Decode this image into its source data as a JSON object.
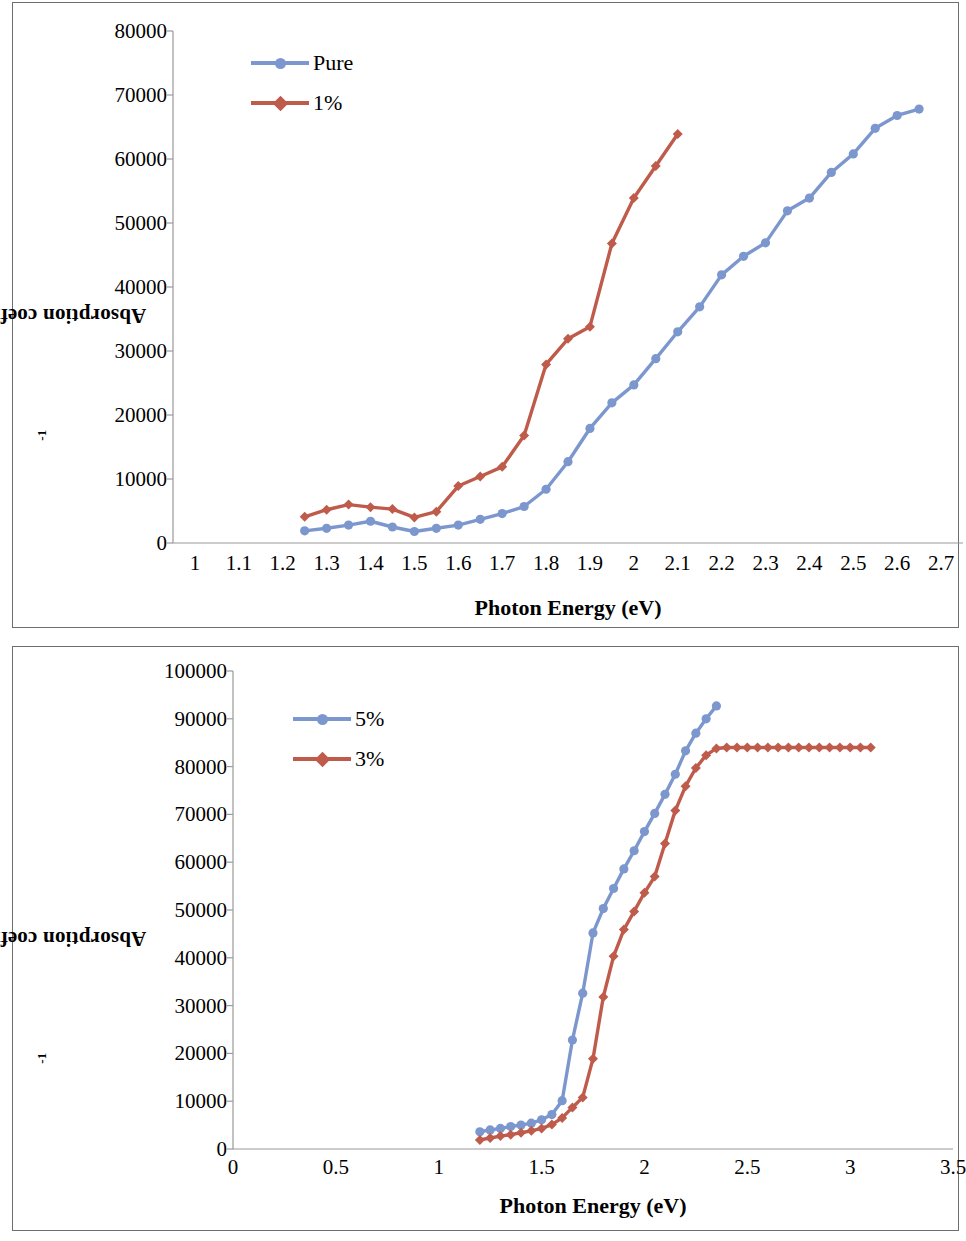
{
  "figure": {
    "panels": [
      "top",
      "bottom"
    ]
  },
  "top": {
    "y_axis_title_main": "Absorption coefficient  (cm)",
    "y_axis_title_sup": "-1",
    "x_axis_title": "Photon Energy (eV)",
    "y_ticks": [
      "0",
      "10000",
      "20000",
      "30000",
      "40000",
      "50000",
      "60000",
      "70000",
      "80000"
    ],
    "x_ticks": [
      "1",
      "1.1",
      "1.2",
      "1.3",
      "1.4",
      "1.5",
      "1.6",
      "1.7",
      "1.8",
      "1.9",
      "2",
      "2.1",
      "2.2",
      "2.3",
      "2.4",
      "2.5",
      "2.6",
      "2.7"
    ],
    "legend": [
      {
        "label": "Pure",
        "color": "#7C97CE",
        "marker": "circle"
      },
      {
        "label": "1%",
        "color": "#BF5B4B",
        "marker": "diamond"
      }
    ],
    "chart_data": {
      "type": "line",
      "title": "",
      "xlabel": "Photon Energy (eV)",
      "ylabel": "Absorption coefficient  (cm)-1",
      "xlim": [
        1.0,
        2.7
      ],
      "ylim": [
        0,
        80000
      ],
      "ytick_step": 10000,
      "xtick_step": 0.1,
      "grid": false,
      "legend_position": "top-left inside",
      "axis_kind": "category",
      "series": [
        {
          "name": "Pure",
          "color": "#7C97CE",
          "marker": "circle",
          "x": [
            1.25,
            1.3,
            1.35,
            1.4,
            1.45,
            1.5,
            1.55,
            1.6,
            1.65,
            1.7,
            1.75,
            1.8,
            1.85,
            1.9,
            1.95,
            2.0,
            2.05,
            2.1,
            2.15,
            2.2,
            2.25,
            2.3,
            2.35,
            2.4,
            2.45,
            2.5,
            2.55,
            2.6,
            2.65
          ],
          "values": [
            1900,
            2300,
            2800,
            3400,
            2500,
            1800,
            2300,
            2800,
            3700,
            4600,
            5700,
            8400,
            12700,
            17900,
            21900,
            24700,
            28800,
            33000,
            36900,
            41900,
            44800,
            46900,
            51900,
            53900,
            57900,
            60800,
            64800,
            66800,
            67800
          ]
        },
        {
          "name": "1%",
          "color": "#BF5B4B",
          "marker": "diamond",
          "x": [
            1.25,
            1.3,
            1.35,
            1.4,
            1.45,
            1.5,
            1.55,
            1.6,
            1.65,
            1.7,
            1.75,
            1.8,
            1.85,
            1.9,
            1.95,
            2.0,
            2.05,
            2.1
          ],
          "values": [
            4100,
            5200,
            6000,
            5600,
            5300,
            4000,
            4900,
            8900,
            10400,
            11900,
            16800,
            27900,
            31900,
            33800,
            46800,
            53900,
            58900,
            63900
          ]
        }
      ]
    }
  },
  "bottom": {
    "y_axis_title_main": "Absorption coefficient  (cm)",
    "y_axis_title_sup": "-1",
    "x_axis_title": "Photon Energy (eV)",
    "y_ticks": [
      "0",
      "10000",
      "20000",
      "30000",
      "40000",
      "50000",
      "60000",
      "70000",
      "80000",
      "90000",
      "100000"
    ],
    "x_ticks": [
      "0",
      "0.5",
      "1",
      "1.5",
      "2",
      "2.5",
      "3",
      "3.5"
    ],
    "legend": [
      {
        "label": "5%",
        "color": "#7C97CE",
        "marker": "circle"
      },
      {
        "label": "3%",
        "color": "#BF5B4B",
        "marker": "diamond"
      }
    ],
    "chart_data": {
      "type": "line",
      "title": "",
      "xlabel": "Photon Energy (eV)",
      "ylabel": "Absorption coefficient  (cm)-1",
      "xlim": [
        0,
        3.5
      ],
      "ylim": [
        0,
        100000
      ],
      "ytick_step": 10000,
      "xtick_step": 0.5,
      "grid": false,
      "legend_position": "top-left inside",
      "axis_kind": "numeric",
      "series": [
        {
          "name": "5%",
          "color": "#7C97CE",
          "marker": "circle",
          "x": [
            1.2,
            1.25,
            1.3,
            1.35,
            1.4,
            1.45,
            1.5,
            1.55,
            1.6,
            1.65,
            1.7,
            1.75,
            1.8,
            1.85,
            1.9,
            1.95,
            2.0,
            2.05,
            2.1,
            2.15,
            2.2,
            2.25,
            2.3,
            2.35
          ],
          "values": [
            3600,
            4000,
            4300,
            4700,
            5000,
            5400,
            6100,
            7200,
            10100,
            22800,
            32600,
            45200,
            50300,
            54500,
            58600,
            62400,
            66400,
            70200,
            74200,
            78400,
            83300,
            87000,
            90000,
            92700
          ]
        },
        {
          "name": "3%",
          "color": "#BF5B4B",
          "marker": "diamond",
          "x": [
            1.2,
            1.25,
            1.3,
            1.35,
            1.4,
            1.45,
            1.5,
            1.55,
            1.6,
            1.65,
            1.7,
            1.75,
            1.8,
            1.85,
            1.9,
            1.95,
            2.0,
            2.05,
            2.1,
            2.15,
            2.2,
            2.25,
            2.3,
            2.35,
            2.4,
            2.45,
            2.5,
            2.55,
            2.6,
            2.65,
            2.7,
            2.75,
            2.8,
            2.85,
            2.9,
            2.95,
            3.0,
            3.05,
            3.1
          ],
          "values": [
            1900,
            2300,
            2700,
            3000,
            3400,
            3800,
            4300,
            5100,
            6500,
            8700,
            10800,
            18900,
            31800,
            40300,
            45900,
            49700,
            53600,
            57000,
            63900,
            70800,
            75900,
            79700,
            82400,
            83800,
            84000,
            84000,
            84000,
            84000,
            84000,
            84000,
            84000,
            84000,
            84000,
            84000,
            84000,
            84000,
            84000,
            84000,
            84000
          ]
        }
      ]
    }
  }
}
